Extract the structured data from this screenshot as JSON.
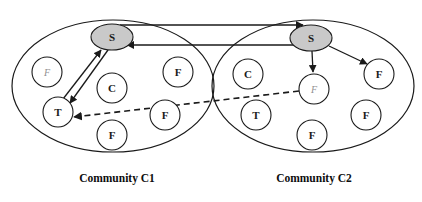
{
  "figure": {
    "background_color": "#ffffff",
    "line_color": "#1a1a1a",
    "hub_fill_color": "#c9c9c9",
    "node_fill_color": "#ffffff",
    "faint_label_color": "#8f8f8f"
  },
  "communities": [
    {
      "id": "c1",
      "caption": "Community C1",
      "nodes": [
        {
          "id": "c1-hub",
          "label": "S",
          "type": "hub",
          "cx": 112,
          "cy": 37,
          "rx": 21,
          "ry": 13,
          "faint": false
        },
        {
          "id": "c1-n-faint",
          "label": "F",
          "type": "node",
          "cx": 47,
          "cy": 72,
          "r": 15,
          "faint": true
        },
        {
          "id": "c1-n-c",
          "label": "C",
          "type": "node",
          "cx": 112,
          "cy": 88,
          "r": 15,
          "faint": false
        },
        {
          "id": "c1-n-f1",
          "label": "F",
          "type": "node",
          "cx": 178,
          "cy": 72,
          "r": 15,
          "faint": false
        },
        {
          "id": "c1-n-t",
          "label": "T",
          "type": "node",
          "cx": 58,
          "cy": 112,
          "r": 15,
          "faint": false
        },
        {
          "id": "c1-n-f2",
          "label": "F",
          "type": "node",
          "cx": 165,
          "cy": 115,
          "r": 15,
          "faint": false
        },
        {
          "id": "c1-n-f3",
          "label": "F",
          "type": "node",
          "cx": 112,
          "cy": 135,
          "r": 15,
          "faint": false
        }
      ]
    },
    {
      "id": "c2",
      "caption": "Community C2",
      "nodes": [
        {
          "id": "c2-hub",
          "label": "S",
          "type": "hub",
          "cx": 311,
          "cy": 38,
          "rx": 21,
          "ry": 13,
          "faint": false
        },
        {
          "id": "c2-n-c",
          "label": "C",
          "type": "node",
          "cx": 248,
          "cy": 74,
          "r": 15,
          "faint": false
        },
        {
          "id": "c2-n-faint",
          "label": "F",
          "type": "node",
          "cx": 314,
          "cy": 89,
          "r": 15,
          "faint": true
        },
        {
          "id": "c2-n-f1",
          "label": "F",
          "type": "node",
          "cx": 379,
          "cy": 74,
          "r": 15,
          "faint": false
        },
        {
          "id": "c2-n-t",
          "label": "T",
          "type": "node",
          "cx": 256,
          "cy": 115,
          "r": 15,
          "faint": false
        },
        {
          "id": "c2-n-f2",
          "label": "F",
          "type": "node",
          "cx": 366,
          "cy": 115,
          "r": 15,
          "faint": false
        },
        {
          "id": "c2-n-f3",
          "label": "F",
          "type": "node",
          "cx": 312,
          "cy": 135,
          "r": 15,
          "faint": false
        }
      ]
    }
  ],
  "edges": [
    {
      "id": "edge-t-to-s-c1",
      "from": "c1-n-t",
      "to": "c1-hub",
      "style": "solid",
      "scope": "intra"
    },
    {
      "id": "edge-s-to-t-c1",
      "from": "c1-hub",
      "to": "c1-n-t",
      "style": "solid",
      "scope": "intra"
    },
    {
      "id": "edge-s1-to-s2",
      "from": "c1-hub",
      "to": "c2-hub",
      "style": "solid",
      "scope": "inter"
    },
    {
      "id": "edge-s2-to-s1",
      "from": "c2-hub",
      "to": "c1-hub",
      "style": "solid",
      "scope": "inter"
    },
    {
      "id": "edge-s2-to-faint",
      "from": "c2-hub",
      "to": "c2-n-faint",
      "style": "solid",
      "scope": "intra"
    },
    {
      "id": "edge-s2-to-f1",
      "from": "c2-hub",
      "to": "c2-n-f1",
      "style": "solid",
      "scope": "intra"
    },
    {
      "id": "edge-faint-to-t1",
      "from": "c2-n-faint",
      "to": "c1-n-t",
      "style": "dashed",
      "scope": "inter"
    }
  ]
}
